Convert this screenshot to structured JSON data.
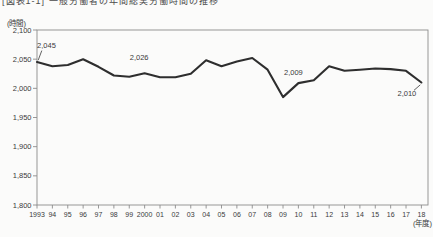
{
  "title_partial": "[図表1-1] 一般労働者の年間総実労働時間の推移",
  "chart_data": {
    "type": "line",
    "title": "",
    "ylabel": "(時間)",
    "xlabel": "(年度)",
    "categories": [
      "1993",
      "94",
      "95",
      "96",
      "97",
      "98",
      "99",
      "2000",
      "01",
      "02",
      "03",
      "04",
      "05",
      "06",
      "07",
      "08",
      "09",
      "10",
      "11",
      "12",
      "13",
      "14",
      "15",
      "16",
      "17",
      "18"
    ],
    "values": [
      2045,
      2038,
      2040,
      2050,
      2037,
      2022,
      2020,
      2026,
      2019,
      2019,
      2025,
      2048,
      2038,
      2046,
      2052,
      2032,
      1985,
      2009,
      2014,
      2038,
      2030,
      2032,
      2034,
      2033,
      2030,
      2010
    ],
    "ylim": [
      1800,
      2100
    ],
    "yticks": [
      {
        "v": 2100,
        "label": "2,100"
      },
      {
        "v": 2050,
        "label": "2,050"
      },
      {
        "v": 2000,
        "label": "2,000"
      },
      {
        "v": 1950,
        "label": "1,950"
      },
      {
        "v": 1900,
        "label": "1,900"
      },
      {
        "v": 1850,
        "label": "1,850"
      },
      {
        "v": 1800,
        "label": "1,800"
      }
    ],
    "grid": false,
    "frame": true,
    "legend": "none",
    "line_color": "#2e2e2e",
    "frame_color": "#8c8c8c",
    "text_color": "#3a3a3a",
    "annotations": [
      {
        "index": 0,
        "text": "2,045"
      },
      {
        "index": 7,
        "text": "2,026"
      },
      {
        "index": 17,
        "text": "2,009"
      },
      {
        "index": 25,
        "text": "2,010"
      }
    ]
  }
}
